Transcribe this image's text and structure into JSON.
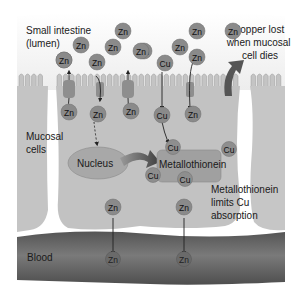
{
  "labels": {
    "lumen": [
      "Small intestine",
      "(lumen)"
    ],
    "mucosal": [
      "Mucosal",
      "cells"
    ],
    "blood": "Blood",
    "copper_lost": [
      "Copper lost",
      "when mucosal",
      "cell dies"
    ],
    "limits": [
      "Metallothionein",
      "limits Cu",
      "absorption"
    ],
    "nucleus": "Nucleus",
    "metallothionein": "Metallothionein"
  },
  "ions": {
    "lumen": [
      "Zn",
      "Zn",
      "Zn",
      "Zn",
      "Zn",
      "Zn",
      "Cu",
      "Zn",
      "Cu",
      "Zn",
      "Zn",
      "Zn",
      "Zn"
    ],
    "cell": [
      "Zn",
      "Zn",
      "Zn",
      "Cu",
      "Zn"
    ],
    "metallothionein_bound": [
      "Cu",
      "Cu",
      "Cu",
      "Cu"
    ],
    "cell_lower": [
      "Zn",
      "Zn"
    ],
    "blood": [
      "Zn",
      "Zn"
    ]
  },
  "colors": {
    "ion_fill": "#8a8a8a",
    "cell_fill": "#c4c4c4",
    "blood_fill": "#5e5e5e",
    "nucleus_fill": "#a8a8a8",
    "metallothionein_fill": "#a0a0a0"
  }
}
